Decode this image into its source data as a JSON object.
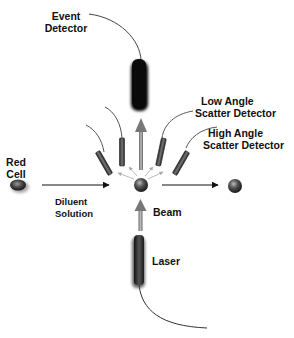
{
  "diagram": {
    "type": "flow-cytometry-schematic",
    "labels": {
      "event_detector": [
        "Event",
        "Detector"
      ],
      "low_angle": [
        "Low Angle",
        "Scatter Detector"
      ],
      "high_angle": [
        "High Angle",
        "Scatter Detector"
      ],
      "red_cell": [
        "Red",
        "Cell"
      ],
      "diluent": [
        "Diluent",
        "Solution"
      ],
      "beam": "Beam",
      "laser": "Laser"
    },
    "colors": {
      "background": "#ffffff",
      "text": "#111111",
      "line": "#222222",
      "detector_dark": "#111111",
      "scatter_arrow": "#999999",
      "cell": "#444444"
    }
  }
}
